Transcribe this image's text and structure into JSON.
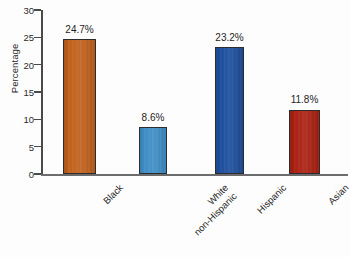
{
  "chart_data": {
    "type": "bar",
    "title": "",
    "xlabel": "",
    "ylabel": "Percentage",
    "ylim": [
      0,
      30
    ],
    "ytick_values": [
      30,
      25,
      20,
      15,
      10,
      5,
      0
    ],
    "ytick_labels": [
      "30",
      "25",
      "20",
      "15",
      "10",
      "5",
      "0"
    ],
    "grid": false,
    "legend": "none",
    "categories": [
      "Black",
      "White non-Hispanic",
      "Hispanic",
      "Asian"
    ],
    "category_lines": [
      [
        "Black"
      ],
      [
        "White",
        "non-Hispanic"
      ],
      [
        "Hispanic"
      ],
      [
        "Asian"
      ]
    ],
    "values": [
      24.7,
      8.6,
      23.2,
      11.8
    ],
    "data_labels": [
      "24.7%",
      "8.6%",
      "23.2%",
      "11.8%"
    ],
    "bar_colors": [
      "#c3621d",
      "#3f8fc8",
      "#1d4f9e",
      "#ad2111"
    ],
    "bar_edge_color": "#2c2c2c",
    "axis_color": "#4a4a4a",
    "background_color": "#fdfdfd"
  }
}
